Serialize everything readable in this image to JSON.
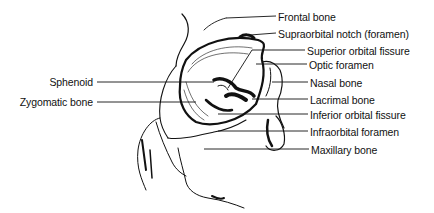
{
  "diagram": {
    "labels_right": [
      {
        "text": "Frontal bone",
        "x": 278,
        "y": 11
      },
      {
        "text": "Supraorbital notch (foramen)",
        "x": 278,
        "y": 28
      },
      {
        "text": "Superior orbital fissure",
        "x": 307,
        "y": 45
      },
      {
        "text": "Optic foramen",
        "x": 309,
        "y": 59
      },
      {
        "text": "Nasal bone",
        "x": 310,
        "y": 77
      },
      {
        "text": "Lacrimal bone",
        "x": 310,
        "y": 94
      },
      {
        "text": "Inferior orbital fissure",
        "x": 310,
        "y": 109
      },
      {
        "text": "Infraorbital foramen",
        "x": 310,
        "y": 126
      },
      {
        "text": "Maxillary bone",
        "x": 311,
        "y": 144
      }
    ],
    "labels_left": [
      {
        "text": "Sphenoid",
        "x": 95,
        "y": 77
      },
      {
        "text": "Zygomatic bone",
        "x": 95,
        "y": 97
      }
    ]
  }
}
